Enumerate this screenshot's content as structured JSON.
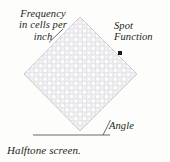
{
  "figure": {
    "caption": "Halftone screen.",
    "labels": {
      "frequency": "Frequency\nin cells per\ninch",
      "spot_function": "Spot\nFunction",
      "angle": "Angle"
    },
    "colors": {
      "background": "#fdfdfb",
      "text": "#231f20",
      "grid_line": "#c9c9cf",
      "grid_fill": "#f2f2f5",
      "baseline": "#58585b",
      "leader": "#58585b",
      "spot_dot": "#1a1a1a"
    },
    "icons": {
      "spot": "spot-dot-icon"
    }
  },
  "diagram_data": {
    "type": "annotated-illustration",
    "subject": "halftone screen lattice",
    "screen": {
      "shape": "square rotated 45 degrees (diamond)",
      "rotation_deg": 45,
      "center": {
        "x": 80.5,
        "y": 74
      },
      "half_diagonal_px": 57,
      "cells_across": 13,
      "cell_pitch_px": 6.2,
      "corners": {
        "top": {
          "x": 80,
          "y": 17
        },
        "right": {
          "x": 137,
          "y": 74
        },
        "bottom": {
          "x": 80,
          "y": 131
        },
        "left": {
          "x": 24,
          "y": 74
        }
      }
    },
    "baseline": {
      "label": "Angle",
      "x1": 33,
      "y1": 135,
      "x2": 110,
      "y2": 135
    },
    "angle_marker": {
      "vertex": {
        "x": 103,
        "y": 135
      },
      "leader_to": {
        "x": 110,
        "y": 121
      },
      "measures": "angle between screen edge and horizontal"
    },
    "frequency_leader": {
      "from": {
        "x": 49,
        "y": 42
      },
      "to": {
        "x": 62,
        "y": 30
      }
    },
    "spot_marker": {
      "x": 120,
      "y": 53,
      "size_px": 4
    }
  }
}
